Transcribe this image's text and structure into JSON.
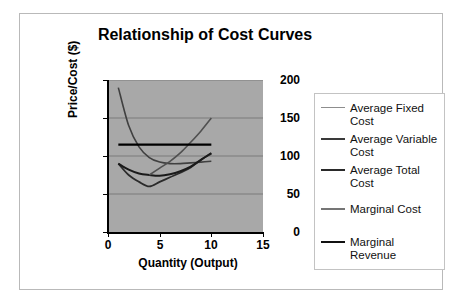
{
  "chart_data": {
    "type": "line",
    "title": "Relationship of Cost Curves",
    "xlabel": "Quantity (Output)",
    "ylabel": "Price/Cost ($)",
    "xlim": [
      0,
      15
    ],
    "ylim": [
      0,
      200
    ],
    "xticks": [
      "0",
      "5",
      "10",
      "15"
    ],
    "yticks": [
      "0",
      "50",
      "100",
      "150",
      "200"
    ],
    "grid": "horizontal",
    "plot_background": "#a8a8a8",
    "legend_position": "right",
    "x": [
      1,
      2,
      3,
      4,
      5,
      6,
      7,
      8,
      9,
      10
    ],
    "series": [
      {
        "name": "Average Fixed Cost",
        "color": "#404040",
        "width": 1.6,
        "values": [
          190,
          140,
          112,
          98,
          92,
          90,
          90,
          91,
          92,
          93
        ]
      },
      {
        "name": "Average Variable Cost",
        "color": "#2b2b2b",
        "width": 1.8,
        "values": [
          90,
          75,
          66,
          60,
          66,
          72,
          78,
          85,
          95,
          103
        ]
      },
      {
        "name": "Average Total Cost",
        "color": "#1a1a1a",
        "width": 2.0,
        "values": [
          90,
          82,
          77,
          75,
          74,
          76,
          80,
          86,
          95,
          104
        ]
      },
      {
        "name": "Marginal Cost",
        "color": "#505050",
        "width": 1.6,
        "values": [
          null,
          null,
          null,
          75,
          84,
          93,
          104,
          118,
          133,
          150
        ]
      },
      {
        "name": "Marginal Revenue",
        "color": "#000000",
        "width": 2.4,
        "values": [
          115,
          115,
          115,
          115,
          115,
          115,
          115,
          115,
          115,
          115
        ]
      }
    ]
  },
  "legend": {
    "items": [
      {
        "label": "Average Fixed Cost",
        "swatch_color": "#8d8d8d",
        "swatch_height": "1px"
      },
      {
        "label": "Average Variable Cost",
        "swatch_color": "#3a3a3a",
        "swatch_height": "2px"
      },
      {
        "label": "Average Total Cost",
        "swatch_color": "#2a2a2a",
        "swatch_height": "2px"
      },
      {
        "label": "Marginal Cost",
        "swatch_color": "#757575",
        "swatch_height": "2px"
      },
      {
        "label": "Marginal Revenue",
        "swatch_color": "#111111",
        "swatch_height": "2px"
      }
    ]
  }
}
